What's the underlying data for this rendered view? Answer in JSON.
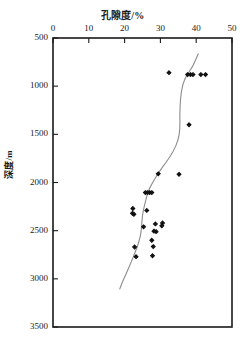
{
  "chart_data": {
    "type": "scatter",
    "title": "孔隙度/%",
    "xlabel": "孔隙度/%",
    "ylabel": "深度/m",
    "xlim": [
      0,
      50
    ],
    "ylim": [
      3500,
      500
    ],
    "y_inverted": true,
    "x_axis_position": "top",
    "grid": false,
    "legend": null,
    "xticks": [
      0,
      10,
      20,
      30,
      40,
      50
    ],
    "yticks": [
      500,
      1000,
      1500,
      2000,
      2500,
      3000,
      3500
    ],
    "marker": "filled-diamond",
    "marker_color": "#111111",
    "points": [
      {
        "x": 32.4,
        "y": 860
      },
      {
        "x": 37.6,
        "y": 880
      },
      {
        "x": 38.4,
        "y": 880
      },
      {
        "x": 39.1,
        "y": 880
      },
      {
        "x": 41.3,
        "y": 880
      },
      {
        "x": 42.6,
        "y": 880
      },
      {
        "x": 38.0,
        "y": 1400
      },
      {
        "x": 29.4,
        "y": 1910
      },
      {
        "x": 35.2,
        "y": 1915
      },
      {
        "x": 25.8,
        "y": 2105
      },
      {
        "x": 26.4,
        "y": 2105
      },
      {
        "x": 27.0,
        "y": 2105
      },
      {
        "x": 27.6,
        "y": 2105
      },
      {
        "x": 22.3,
        "y": 2270
      },
      {
        "x": 22.2,
        "y": 2320
      },
      {
        "x": 22.6,
        "y": 2330
      },
      {
        "x": 26.2,
        "y": 2290
      },
      {
        "x": 25.3,
        "y": 2460
      },
      {
        "x": 28.6,
        "y": 2430
      },
      {
        "x": 30.6,
        "y": 2420
      },
      {
        "x": 28.2,
        "y": 2505
      },
      {
        "x": 28.8,
        "y": 2510
      },
      {
        "x": 30.4,
        "y": 2450
      },
      {
        "x": 27.6,
        "y": 2600
      },
      {
        "x": 22.8,
        "y": 2670
      },
      {
        "x": 28.0,
        "y": 2665
      },
      {
        "x": 23.2,
        "y": 2770
      },
      {
        "x": 27.8,
        "y": 2760
      }
    ],
    "trend_line": {
      "name": "fitted-trend",
      "color": "#8c8c8c",
      "points": [
        {
          "x": 40.6,
          "y": 660
        },
        {
          "x": 39.0,
          "y": 800
        },
        {
          "x": 37.4,
          "y": 880
        },
        {
          "x": 36.2,
          "y": 980
        },
        {
          "x": 35.6,
          "y": 1120
        },
        {
          "x": 35.4,
          "y": 1300
        },
        {
          "x": 35.5,
          "y": 1440
        },
        {
          "x": 35.0,
          "y": 1560
        },
        {
          "x": 33.6,
          "y": 1680
        },
        {
          "x": 31.6,
          "y": 1790
        },
        {
          "x": 29.6,
          "y": 1890
        },
        {
          "x": 28.0,
          "y": 1990
        },
        {
          "x": 26.8,
          "y": 2070
        },
        {
          "x": 26.2,
          "y": 2140
        },
        {
          "x": 25.6,
          "y": 2230
        },
        {
          "x": 25.0,
          "y": 2330
        },
        {
          "x": 24.8,
          "y": 2430
        },
        {
          "x": 24.6,
          "y": 2520
        },
        {
          "x": 24.0,
          "y": 2620
        },
        {
          "x": 23.0,
          "y": 2720
        },
        {
          "x": 21.8,
          "y": 2830
        },
        {
          "x": 20.4,
          "y": 2950
        },
        {
          "x": 19.2,
          "y": 3050
        },
        {
          "x": 18.6,
          "y": 3110
        }
      ]
    }
  },
  "axes": {
    "top_title": "孔隙度/%",
    "left_title": "深度/m",
    "x_tick_labels": [
      "0",
      "10",
      "20",
      "30",
      "40",
      "50"
    ],
    "y_tick_labels": [
      "500",
      "1000",
      "1500",
      "2000",
      "2500",
      "3000",
      "3500"
    ]
  },
  "colors": {
    "frame": "#1a1a1a",
    "marker": "#111111",
    "trend": "#8c8c8c",
    "background": "#ffffff"
  },
  "caption": {
    "partial_text": ""
  }
}
